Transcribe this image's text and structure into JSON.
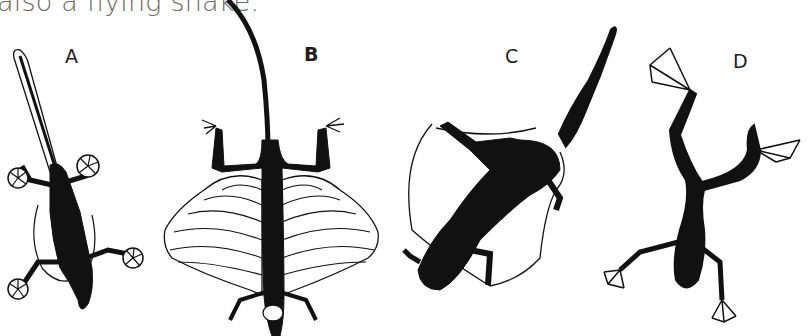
{
  "caption": "also a flying snake.",
  "figure": {
    "panels": [
      {
        "label": "A",
        "subject": "gliding-gecko-icon"
      },
      {
        "label": "B",
        "subject": "flying-dragon-lizard-icon"
      },
      {
        "label": "C",
        "subject": "gliding-mammal-icon"
      },
      {
        "label": "D",
        "subject": "flying-frog-icon"
      }
    ]
  },
  "colors": {
    "ink": "#111111",
    "caption": "#6a6a6a",
    "background": "#ffffff"
  }
}
